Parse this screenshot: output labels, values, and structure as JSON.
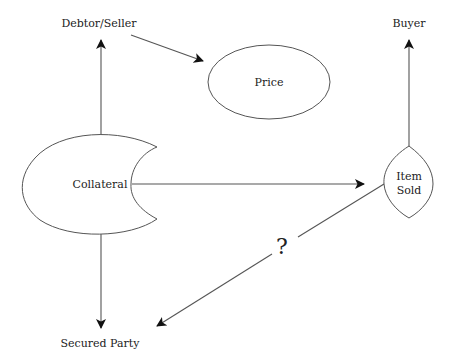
{
  "diagram": {
    "nodes": {
      "debtor_seller": {
        "label": "Debtor/Seller"
      },
      "price": {
        "label": "Price"
      },
      "buyer": {
        "label": "Buyer"
      },
      "collateral": {
        "label": "Collateral"
      },
      "item_sold": {
        "line1": "Item",
        "line2": "Sold"
      },
      "secured_party": {
        "label": "Secured Party"
      }
    },
    "edges": [
      {
        "from": "Collateral",
        "to": "Debtor/Seller"
      },
      {
        "from": "Debtor/Seller",
        "to": "Price"
      },
      {
        "from": "Item Sold",
        "to": "Buyer"
      },
      {
        "from": "Collateral",
        "to": "Item Sold"
      },
      {
        "from": "Collateral",
        "to": "Secured Party"
      },
      {
        "from": "Item Sold",
        "to": "Secured Party",
        "label": "?"
      }
    ],
    "question_mark": "?",
    "colors": {
      "stroke": "#555555",
      "text": "#222222",
      "background": "#ffffff"
    }
  }
}
